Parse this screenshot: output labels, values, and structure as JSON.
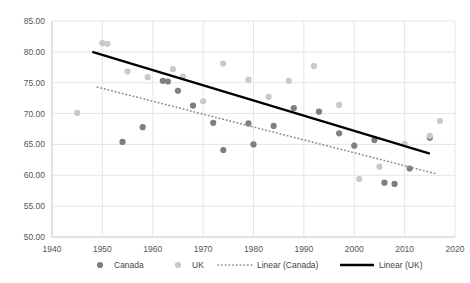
{
  "chart_data": {
    "type": "scatter",
    "title": "",
    "xlabel": "",
    "ylabel": "",
    "xlim": [
      1940,
      2020
    ],
    "ylim": [
      50.0,
      85.0
    ],
    "xticks": [
      1940,
      1950,
      1960,
      1970,
      1980,
      1990,
      2000,
      2010,
      2020
    ],
    "xtick_labels": [
      "1940",
      "1950",
      "1960",
      "1970",
      "1980",
      "1990",
      "2000",
      "2010",
      "2020"
    ],
    "yticks": [
      50.0,
      55.0,
      60.0,
      65.0,
      70.0,
      75.0,
      80.0,
      85.0
    ],
    "ytick_labels": [
      "50.00",
      "55.00",
      "60.00",
      "65.00",
      "70.00",
      "75.00",
      "80.00",
      "85.00"
    ],
    "grid": true,
    "legend_position": "bottom",
    "series": [
      {
        "name": "Canada",
        "type": "scatter",
        "marker": "circle",
        "color": "#7f7f7f",
        "points": [
          [
            1954,
            65.4
          ],
          [
            1958,
            67.8
          ],
          [
            1962,
            75.3
          ],
          [
            1963,
            75.2
          ],
          [
            1965,
            73.7
          ],
          [
            1968,
            71.3
          ],
          [
            1972,
            68.5
          ],
          [
            1974,
            64.1
          ],
          [
            1979,
            68.4
          ],
          [
            1980,
            65.0
          ],
          [
            1984,
            68.0
          ],
          [
            1988,
            70.9
          ],
          [
            1993,
            70.3
          ],
          [
            1997,
            66.8
          ],
          [
            2000,
            64.8
          ],
          [
            2004,
            65.7
          ],
          [
            2006,
            58.8
          ],
          [
            2008,
            58.6
          ],
          [
            2011,
            61.1
          ],
          [
            2015,
            66.1
          ]
        ]
      },
      {
        "name": "UK",
        "type": "scatter",
        "marker": "circle",
        "color": "#c9c9c9",
        "points": [
          [
            1945,
            70.1
          ],
          [
            1950,
            81.4
          ],
          [
            1951,
            81.3
          ],
          [
            1955,
            76.8
          ],
          [
            1959,
            75.9
          ],
          [
            1964,
            77.2
          ],
          [
            1966,
            76.0
          ],
          [
            1970,
            72.0
          ],
          [
            1974,
            78.1
          ],
          [
            1979,
            75.5
          ],
          [
            1983,
            72.7
          ],
          [
            1987,
            75.3
          ],
          [
            1992,
            77.7
          ],
          [
            1997,
            71.4
          ],
          [
            2001,
            59.4
          ],
          [
            2005,
            61.4
          ],
          [
            2010,
            65.1
          ],
          [
            2015,
            66.4
          ],
          [
            2017,
            68.8
          ]
        ]
      },
      {
        "name": "Linear (Canada)",
        "type": "line",
        "style": "dotted",
        "color": "#8c8c8c",
        "endpoints": [
          [
            1949,
            74.3
          ],
          [
            2016,
            60.3
          ]
        ]
      },
      {
        "name": "Linear (UK)",
        "type": "line",
        "style": "solid",
        "color": "#000000",
        "endpoints": [
          [
            1948,
            80.0
          ],
          [
            2015,
            63.5
          ]
        ]
      }
    ]
  },
  "legend": {
    "items": [
      {
        "label": "Canada",
        "marker": "dot",
        "color": "#7f7f7f"
      },
      {
        "label": "UK",
        "marker": "dot",
        "color": "#c9c9c9"
      },
      {
        "label": "Linear (Canada)",
        "marker": "dotted-line",
        "color": "#8c8c8c"
      },
      {
        "label": "Linear (UK)",
        "marker": "solid-line",
        "color": "#000000"
      }
    ]
  },
  "colors": {
    "background": "#ffffff",
    "grid": "#e6e6e6",
    "axis": "#d0d0d0",
    "text": "#555555",
    "canada": "#7f7f7f",
    "uk": "#c9c9c9",
    "trend_uk": "#000000",
    "trend_canada": "#8c8c8c"
  }
}
